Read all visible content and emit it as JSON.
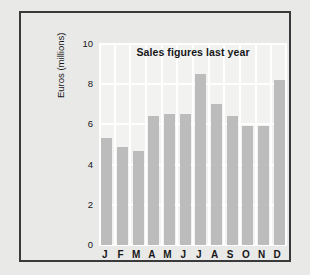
{
  "page": {
    "background_color": "#e9e9e7",
    "frame_border_color": "#3a3a3c"
  },
  "chart_data": {
    "type": "bar",
    "title": "Sales figures last year",
    "xlabel": "",
    "ylabel": "Euros (millions)",
    "categories": [
      "J",
      "F",
      "M",
      "A",
      "M",
      "J",
      "J",
      "A",
      "S",
      "O",
      "N",
      "D"
    ],
    "values": [
      5.3,
      4.9,
      4.7,
      6.4,
      6.5,
      6.5,
      8.5,
      7.0,
      6.4,
      5.9,
      5.9,
      8.2
    ],
    "ylim": [
      0,
      10
    ],
    "yticks": [
      0,
      2,
      4,
      6,
      8,
      10
    ],
    "ytick_labels": [
      "0",
      "2",
      "4",
      "6",
      "8",
      "10"
    ],
    "grid": true,
    "grid_color": "#ffffff",
    "legend": "none",
    "bar_color": "#bcbcbc",
    "plot_background": "#f2f2f0"
  }
}
